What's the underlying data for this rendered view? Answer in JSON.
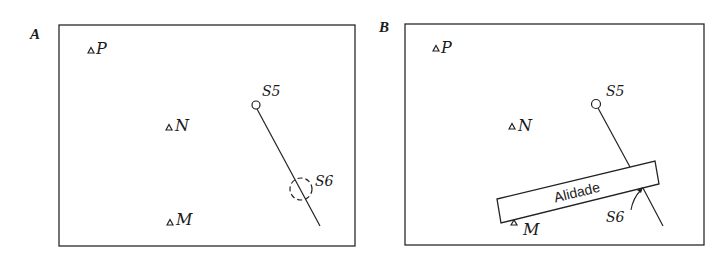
{
  "figure": {
    "panels": [
      {
        "id": "A",
        "label": "A",
        "points": {
          "P": "P",
          "N": "N",
          "M": "M"
        },
        "stations": {
          "s5": "S5",
          "s6": "S6"
        }
      },
      {
        "id": "B",
        "label": "B",
        "points": {
          "P": "P",
          "N": "N",
          "M": "M"
        },
        "stations": {
          "s5": "S5",
          "s6": "S6"
        },
        "alidade_label": "Alidade"
      }
    ],
    "colors": {
      "ink": "#1a1a1a",
      "background": "#ffffff"
    }
  }
}
